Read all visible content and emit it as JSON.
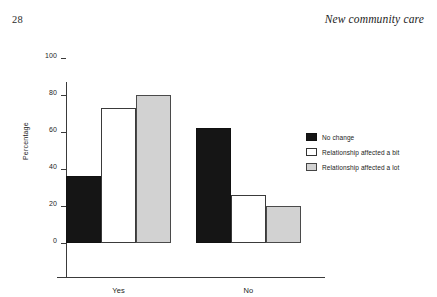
{
  "page": {
    "folio": "28",
    "running_head": "New community care"
  },
  "chart_data": {
    "type": "bar",
    "title": "",
    "xlabel": "Night-time care",
    "ylabel": "Percentage",
    "categories": [
      "Yes",
      "No"
    ],
    "series": [
      {
        "name": "No change",
        "values": [
          36,
          62
        ],
        "color": "#151515",
        "swatch": "fill-black"
      },
      {
        "name": "Relationship affected a bit",
        "values": [
          73,
          26
        ],
        "color": "#ffffff",
        "swatch": "fill-white"
      },
      {
        "name": "Relationship affected a lot",
        "values": [
          80,
          20
        ],
        "color": "#d2d2d2",
        "swatch": "fill-gray"
      }
    ],
    "ylim": [
      0,
      100
    ],
    "yticks": [
      0,
      20,
      40,
      60,
      80,
      100
    ],
    "ytick_labels": [
      "0",
      "20",
      "40",
      "60",
      "80",
      "100"
    ],
    "grid": false,
    "legend_position": "right"
  }
}
